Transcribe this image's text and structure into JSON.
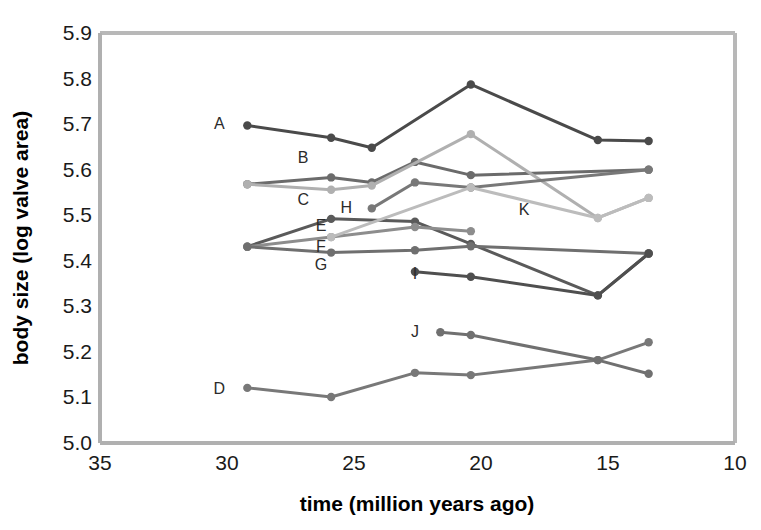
{
  "chart_data": {
    "type": "line",
    "title": "",
    "subtitle": "",
    "xlabel": "time (million years ago)",
    "ylabel": "body size (log valve area)",
    "xlim": [
      35,
      10
    ],
    "ylim": [
      5.0,
      5.9
    ],
    "x_reversed": true,
    "xticks": [
      "35",
      "30",
      "25",
      "20",
      "15",
      "10"
    ],
    "xtick_values": [
      35,
      30,
      25,
      20,
      15,
      10
    ],
    "yticks": [
      "5.9",
      "5.8",
      "5.7",
      "5.6",
      "5.5",
      "5.4",
      "5.3",
      "5.2",
      "5.1",
      "5.0"
    ],
    "ytick_values": [
      5.9,
      5.8,
      5.7,
      5.6,
      5.5,
      5.4,
      5.3,
      5.2,
      5.1,
      5.0
    ],
    "grid": false,
    "legend": "inline-series-labels",
    "marker": "filled-circle",
    "series": [
      {
        "name": "A",
        "color": "#4a4a4a",
        "label_x": 30.3,
        "label_y": 5.7,
        "x": [
          29.2,
          25.9,
          24.3,
          20.4,
          15.4,
          13.4
        ],
        "y": [
          5.697,
          5.67,
          5.648,
          5.787,
          5.665,
          5.663
        ]
      },
      {
        "name": "B",
        "color": "#6b6b6b",
        "label_x": 27.0,
        "label_y": 5.625,
        "x": [
          29.2,
          25.9,
          24.3,
          22.6,
          20.4,
          13.4
        ],
        "y": [
          5.568,
          5.583,
          5.572,
          5.617,
          5.588,
          5.6
        ]
      },
      {
        "name": "C",
        "color": "#b0b0b0",
        "label_x": 27.0,
        "label_y": 5.533,
        "x": [
          29.2,
          25.9,
          24.3,
          20.4,
          15.4,
          13.4
        ],
        "y": [
          5.568,
          5.556,
          5.565,
          5.678,
          5.494,
          5.538
        ]
      },
      {
        "name": "D",
        "color": "#787878",
        "label_x": 30.3,
        "label_y": 5.118,
        "x": [
          29.2,
          25.9,
          22.6,
          20.4,
          15.4,
          13.4
        ],
        "y": [
          5.121,
          5.101,
          5.154,
          5.149,
          5.182,
          5.221
        ]
      },
      {
        "name": "E",
        "color": "#5a5a5a",
        "label_x": 26.3,
        "label_y": 5.476,
        "x": [
          29.2,
          25.9,
          22.6,
          20.4,
          15.4,
          13.4
        ],
        "y": [
          5.431,
          5.492,
          5.486,
          5.437,
          5.324,
          5.416
        ]
      },
      {
        "name": "F",
        "color": "#8d8d8d",
        "label_x": 26.3,
        "label_y": 5.43,
        "x": [
          29.2,
          25.9,
          22.6,
          20.4
        ],
        "y": [
          5.431,
          5.452,
          5.474,
          5.465
        ]
      },
      {
        "name": "G",
        "color": "#6f6f6f",
        "label_x": 26.3,
        "label_y": 5.39,
        "x": [
          29.2,
          25.9,
          22.6,
          20.4,
          13.4
        ],
        "y": [
          5.431,
          5.418,
          5.423,
          5.432,
          5.416
        ]
      },
      {
        "name": "H",
        "color": "#787878",
        "label_x": 25.3,
        "label_y": 5.515,
        "x": [
          24.3,
          22.6,
          20.4,
          13.4
        ],
        "y": [
          5.515,
          5.572,
          5.561,
          5.6
        ]
      },
      {
        "name": "I",
        "color": "#4f4f4f",
        "label_x": 22.6,
        "label_y": 5.372,
        "x": [
          22.6,
          20.4,
          15.4,
          13.4
        ],
        "y": [
          5.376,
          5.365,
          5.324,
          5.416
        ]
      },
      {
        "name": "J",
        "color": "#707070",
        "label_x": 22.6,
        "label_y": 5.243,
        "x": [
          21.6,
          20.4,
          15.4,
          13.4
        ],
        "y": [
          5.243,
          5.237,
          5.182,
          5.152
        ]
      },
      {
        "name": "K",
        "color": "#bcbcbc",
        "label_x": 18.3,
        "label_y": 5.512,
        "x": [
          25.9,
          20.4,
          15.4,
          13.4
        ],
        "y": [
          5.452,
          5.561,
          5.494,
          5.538
        ]
      }
    ]
  },
  "axes": {
    "frame_color": "#b5b5b5",
    "text_color": "#1a1a1a"
  }
}
